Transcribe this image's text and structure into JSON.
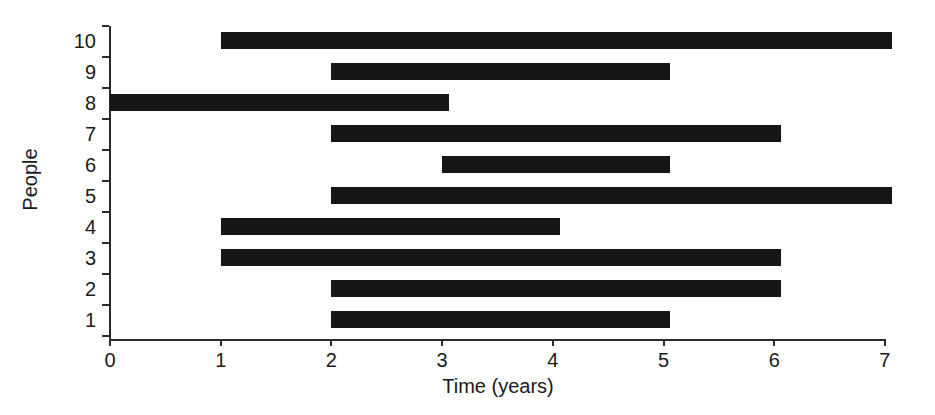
{
  "chart_data": {
    "type": "bar",
    "orientation": "horizontal",
    "title": "",
    "xlabel": "Time (years)",
    "ylabel": "People",
    "xlim": [
      0,
      7
    ],
    "ylim": [
      0.5,
      10.5
    ],
    "grid": false,
    "legend": null,
    "bar_color": "#161616",
    "axis_color": "#2b2b2b",
    "background": "#ffffff",
    "x_ticks": [
      0,
      1,
      2,
      3,
      4,
      5,
      6,
      7
    ],
    "x_tick_labels": [
      "0",
      "1",
      "2",
      "3",
      "4",
      "5",
      "6",
      "7"
    ],
    "y_ticks": [
      1,
      2,
      3,
      4,
      5,
      6,
      7,
      8,
      9,
      10
    ],
    "y_tick_labels": [
      "1",
      "2",
      "3",
      "4",
      "5",
      "6",
      "7",
      "8",
      "9",
      "10"
    ],
    "categories": [
      "1",
      "2",
      "3",
      "4",
      "5",
      "6",
      "7",
      "8",
      "9",
      "10"
    ],
    "bars": [
      {
        "person": "10",
        "start": 1,
        "end": 7,
        "duration": 6
      },
      {
        "person": "9",
        "start": 2,
        "end": 5,
        "duration": 3
      },
      {
        "person": "8",
        "start": 0,
        "end": 3,
        "duration": 3
      },
      {
        "person": "7",
        "start": 2,
        "end": 6,
        "duration": 4
      },
      {
        "person": "6",
        "start": 3,
        "end": 5,
        "duration": 2
      },
      {
        "person": "5",
        "start": 2,
        "end": 7,
        "duration": 5
      },
      {
        "person": "4",
        "start": 1,
        "end": 4,
        "duration": 3
      },
      {
        "person": "3",
        "start": 1,
        "end": 6,
        "duration": 5
      },
      {
        "person": "2",
        "start": 2,
        "end": 6,
        "duration": 4
      },
      {
        "person": "1",
        "start": 2,
        "end": 5,
        "duration": 3
      }
    ]
  }
}
